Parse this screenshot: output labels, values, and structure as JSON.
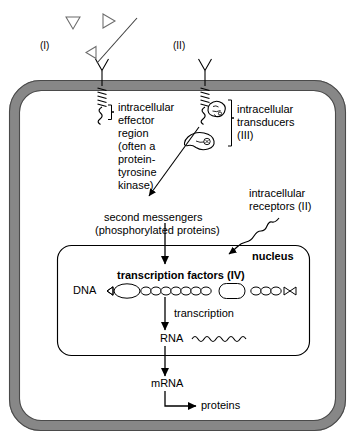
{
  "diagram": {
    "type": "biological-signal-transduction",
    "background_color": "#ffffff",
    "membrane_color": "#878787",
    "membrane_outline": "#3b3b3b",
    "nucleus_outline": "#000000",
    "line_color": "#000000"
  },
  "labels": {
    "pathway_one": "(I)",
    "pathway_two": "(II)",
    "effector_region": "intracellular\neffector\nregion\n(often a\nprotein-\ntyrosine\nkinase)",
    "effector_region_lines": [
      "intracellular",
      "effector",
      "region",
      "(often a",
      "protein-",
      "tyrosine",
      "kinase)"
    ],
    "transducers_lines": [
      "intracellular",
      "transducers",
      "(III)"
    ],
    "intracellular_receptors_lines": [
      "intracellular",
      "receptors (II)"
    ],
    "second_messengers_line1": "second messengers",
    "second_messengers_line2": "(phosphorylated proteins)",
    "nucleus": "nucleus",
    "transcription_factors": "transcription factors (IV)",
    "dna": "DNA",
    "transcription": "transcription",
    "rna": "RNA",
    "mrna": "mRNA",
    "proteins": "proteins"
  },
  "elements": {
    "ligand_icon": "triangle-ligand",
    "receptor_icon": "y-shaped-receptor",
    "transmembrane_icon": "coiled-transmembrane-domain",
    "transducer_icon": "transducer-blob",
    "dna_icon": "dna-bead-strand",
    "rna_icon": "rna-squiggle",
    "arrow_icon": "arrow-head"
  },
  "dna_strand": {
    "bead_count": 14,
    "transcription_factor_count": 2
  }
}
